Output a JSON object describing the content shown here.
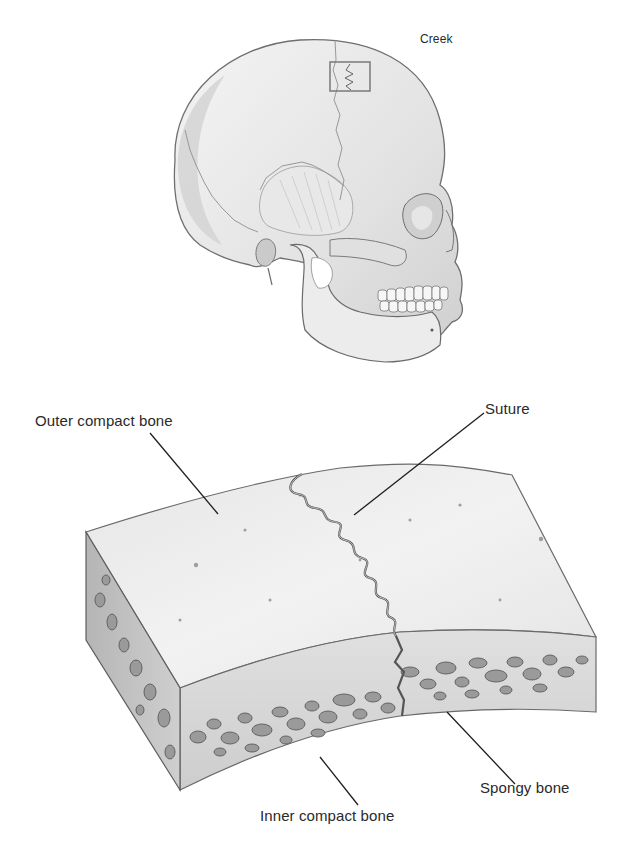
{
  "figure": {
    "skull": {
      "corner_label": "Creek",
      "inset_box": "highlighted suture region"
    },
    "bone_section": {
      "labels": {
        "outer_compact": "Outer compact bone",
        "suture": "Suture",
        "spongy": "Spongy bone",
        "inner_compact": "Inner compact bone"
      }
    },
    "colors": {
      "line": "#1e1e1e",
      "shade_dark": "#8a8a8a",
      "shade_mid": "#c4c4c4",
      "shade_light": "#ececec",
      "inset_box": "#7a7a7a"
    }
  }
}
